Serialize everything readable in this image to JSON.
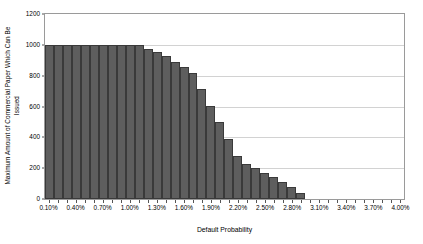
{
  "chart_data": {
    "type": "bar",
    "title": "",
    "xlabel": "Default Probability",
    "ylabel": "Maximum Amount of Commercial Paper Which Can Be Issued",
    "ylabel_lines": [
      "Maximum Amount of Commercial Paper Which Can Be",
      "Issued"
    ],
    "ylim": [
      0,
      1200
    ],
    "yticks": [
      0,
      200,
      400,
      600,
      800,
      1000,
      1200
    ],
    "ytick_labels": [
      "0",
      "200",
      "400",
      "600",
      "800",
      "1000",
      "1200"
    ],
    "grid": true,
    "grid_axis": "y",
    "legend": false,
    "bar_color": "#5e5e5e",
    "bar_edge_color": "#3a3a3a",
    "gridline_color": "#d2d2d2",
    "axis_color": "#9a9a9a",
    "categories": [
      "0.10%",
      "0.20%",
      "0.30%",
      "0.40%",
      "0.50%",
      "0.60%",
      "0.70%",
      "0.80%",
      "0.90%",
      "1.00%",
      "1.10%",
      "1.20%",
      "1.30%",
      "1.40%",
      "1.50%",
      "1.60%",
      "1.70%",
      "1.80%",
      "1.90%",
      "2.00%",
      "2.10%",
      "2.20%",
      "2.30%",
      "2.40%",
      "2.50%",
      "2.60%",
      "2.70%",
      "2.80%",
      "2.90%",
      "3.00%",
      "3.10%",
      "3.20%",
      "3.30%",
      "3.40%",
      "3.50%",
      "3.60%",
      "3.70%",
      "3.80%",
      "3.90%",
      "4.00%"
    ],
    "xtick_labels": [
      "0.10%",
      "0.40%",
      "0.70%",
      "1.00%",
      "1.30%",
      "1.60%",
      "1.90%",
      "2.20%",
      "2.50%",
      "2.80%",
      "3.10%",
      "3.40%",
      "3.70%",
      "4.00%"
    ],
    "xtick_label_indices": [
      0,
      3,
      6,
      9,
      12,
      15,
      18,
      21,
      24,
      27,
      30,
      33,
      36,
      39
    ],
    "values": [
      1000,
      1000,
      1000,
      1000,
      1000,
      1000,
      1000,
      1000,
      1000,
      1000,
      1000,
      975,
      955,
      925,
      890,
      855,
      820,
      715,
      605,
      500,
      390,
      280,
      230,
      200,
      170,
      140,
      110,
      75,
      40,
      0,
      0,
      0,
      0,
      0,
      0,
      0,
      0,
      0,
      0,
      0
    ]
  }
}
